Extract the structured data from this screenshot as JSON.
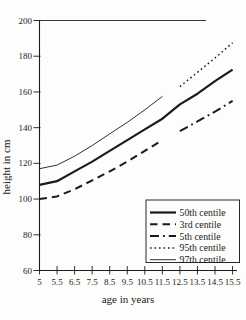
{
  "chart_data": {
    "type": "line",
    "title": "",
    "xlabel": "age in years",
    "ylabel": "height in cm",
    "x_tick_labels": [
      "5",
      "5.5",
      "6.5",
      "7.5",
      "8.5",
      "9.5",
      "10.5",
      "11.5",
      "12.5",
      "13.5",
      "14.5",
      "15.5"
    ],
    "x_values_years": [
      5,
      5.5,
      6.5,
      7.5,
      8.5,
      9.5,
      10.5,
      11.5,
      12.5,
      13.5,
      14.5,
      15.5
    ],
    "y_ticks": [
      60,
      80,
      100,
      120,
      140,
      160,
      180,
      200
    ],
    "ylim": [
      60,
      200
    ],
    "top_gridline_value": 200,
    "legend_position": "lower-right",
    "line_color": "#1b1b1b",
    "series": [
      {
        "name": "50th centile",
        "style": "solid-thick",
        "x_start_index": 0,
        "values": [
          108,
          110,
          115.5,
          121,
          127,
          133,
          139,
          145,
          153,
          159,
          166,
          172.5
        ]
      },
      {
        "name": "3rd centile",
        "style": "dashed",
        "x_start_index": 0,
        "values": [
          100,
          101.5,
          105.5,
          110.5,
          115.5,
          121,
          127,
          133
        ]
      },
      {
        "name": "5th centile",
        "style": "dash-dot",
        "x_start_index": 8,
        "values": [
          138,
          143.5,
          149,
          155
        ]
      },
      {
        "name": "95th centile",
        "style": "dotted",
        "x_start_index": 8,
        "values": [
          163,
          171,
          179,
          187.5
        ]
      },
      {
        "name": "97th centile",
        "style": "solid-thin",
        "x_start_index": 0,
        "values": [
          117,
          119,
          124,
          130,
          136.5,
          143,
          150,
          157.5
        ]
      }
    ],
    "legend_entries": [
      "50th centile",
      "3rd centile",
      "5th centile",
      "95th centile",
      "97th centile"
    ]
  }
}
